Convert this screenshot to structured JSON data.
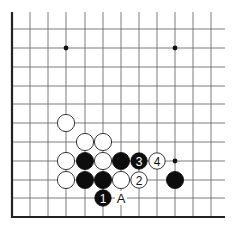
{
  "diagram": {
    "type": "go-board-corner",
    "grid": {
      "columns_x": [
        12,
        30,
        48,
        66,
        85,
        103,
        121,
        139,
        157,
        175,
        193,
        211
      ],
      "rows_y": [
        29,
        48,
        67,
        86,
        104,
        123,
        142,
        161,
        180,
        198
      ],
      "top_y": 12,
      "bottom_edge_y": 217,
      "left_edge_x": 12,
      "right_extent_x": 225
    },
    "star_points": [
      {
        "x": 66,
        "y": 48
      },
      {
        "x": 175,
        "y": 48
      },
      {
        "x": 175,
        "y": 161
      }
    ],
    "stones": [
      {
        "color": "white",
        "x": 66,
        "y": 123,
        "label": ""
      },
      {
        "color": "white",
        "x": 85,
        "y": 142,
        "label": ""
      },
      {
        "color": "white",
        "x": 103,
        "y": 142,
        "label": ""
      },
      {
        "color": "white",
        "x": 66,
        "y": 161,
        "label": ""
      },
      {
        "color": "black",
        "x": 85,
        "y": 161,
        "label": ""
      },
      {
        "color": "white",
        "x": 103,
        "y": 161,
        "label": ""
      },
      {
        "color": "black",
        "x": 121,
        "y": 161,
        "label": ""
      },
      {
        "color": "black",
        "x": 139,
        "y": 161,
        "label": "3"
      },
      {
        "color": "white",
        "x": 157,
        "y": 161,
        "label": "4"
      },
      {
        "color": "white",
        "x": 66,
        "y": 180,
        "label": ""
      },
      {
        "color": "black",
        "x": 85,
        "y": 180,
        "label": ""
      },
      {
        "color": "black",
        "x": 103,
        "y": 180,
        "label": ""
      },
      {
        "color": "white",
        "x": 121,
        "y": 180,
        "label": ""
      },
      {
        "color": "white",
        "x": 139,
        "y": 180,
        "label": "2"
      },
      {
        "color": "black",
        "x": 175,
        "y": 180,
        "label": ""
      },
      {
        "color": "black",
        "x": 103,
        "y": 198,
        "label": "1"
      }
    ],
    "marks": [
      {
        "x": 121,
        "y": 198,
        "text": "A"
      }
    ],
    "colors": {
      "black_stone": "#0d0d0d",
      "white_stone": "#ffffff",
      "grid": "#6e6e6e",
      "edge": "#222222"
    }
  }
}
